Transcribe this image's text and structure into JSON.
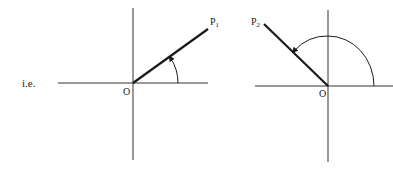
{
  "lead_text": "i.e.",
  "diagrams": [
    {
      "origin_label": "O",
      "point_label": "P",
      "point_subscript": "1",
      "angle_description": "acute angle measured anticlockwise from positive x-axis"
    },
    {
      "origin_label": "O",
      "point_label": "P",
      "point_subscript": "2",
      "angle_description": "obtuse angle measured anticlockwise from positive x-axis"
    }
  ],
  "colors": {
    "line": "#1a1a1a",
    "axis": "#333333",
    "background": "#ffffff"
  }
}
